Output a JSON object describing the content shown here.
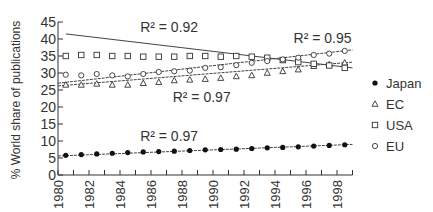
{
  "chart_data": {
    "type": "scatter",
    "title": "",
    "xlabel": "",
    "ylabel": "% World share of publications",
    "xlim": [
      1980,
      1999
    ],
    "ylim": [
      0,
      45
    ],
    "x_ticks": [
      1980,
      1982,
      1984,
      1986,
      1988,
      1990,
      1992,
      1994,
      1996,
      1998
    ],
    "y_ticks": [
      0,
      5,
      10,
      15,
      20,
      25,
      30,
      35,
      40,
      45
    ],
    "grid": false,
    "legend_position": "right",
    "x": [
      1980.5,
      1981.5,
      1982.5,
      1983.5,
      1984.5,
      1985.5,
      1986.5,
      1987.5,
      1988.5,
      1989.5,
      1990.5,
      1991.5,
      1992.5,
      1993.5,
      1994.5,
      1995.5,
      1996.5,
      1997.5,
      1998.5
    ],
    "series": [
      {
        "name": "Japan",
        "marker": "filled-circle",
        "values": [
          5.8,
          6.0,
          6.2,
          6.4,
          6.6,
          6.8,
          6.9,
          7.0,
          7.2,
          7.4,
          7.5,
          7.6,
          7.8,
          8.0,
          8.1,
          8.3,
          8.5,
          8.7,
          8.9
        ],
        "trend": {
          "from": [
            1980,
            5.6
          ],
          "to": [
            1999,
            9.0
          ],
          "r2": "R² = 0.97"
        }
      },
      {
        "name": "EC",
        "marker": "triangle",
        "values": [
          26.5,
          26.5,
          26.8,
          26.5,
          26.5,
          27.0,
          27.3,
          27.8,
          28.0,
          28.2,
          28.5,
          29.0,
          29.3,
          30.0,
          30.5,
          31.0,
          32.0,
          32.5,
          33.0
        ],
        "trend": {
          "from": [
            1980,
            26.2
          ],
          "to": [
            1999,
            33.2
          ],
          "r2": "R² = 0.97"
        }
      },
      {
        "name": "USA",
        "marker": "open-square",
        "values": [
          35.0,
          35.3,
          35.3,
          35.0,
          35.0,
          34.8,
          34.8,
          34.8,
          35.0,
          35.0,
          34.8,
          35.0,
          34.8,
          34.5,
          33.8,
          33.2,
          32.7,
          32.2,
          31.5
        ],
        "trend": {
          "from": [
            1980.5,
            41.5
          ],
          "to": [
            1999,
            31.5
          ],
          "r2": "R² = 0.92"
        }
      },
      {
        "name": "EU",
        "marker": "open-circle",
        "values": [
          29.5,
          29.3,
          29.7,
          29.3,
          29.0,
          29.7,
          30.3,
          30.5,
          30.7,
          31.5,
          31.7,
          32.3,
          33.0,
          33.5,
          34.0,
          34.5,
          35.3,
          35.7,
          36.5
        ],
        "trend": {
          "from": [
            1980,
            27.0
          ],
          "to": [
            1999,
            36.8
          ],
          "r2": "R² = 0.95"
        }
      }
    ],
    "annotations": [
      {
        "text": "R² = 0.92",
        "x": 1985.3,
        "y": 42.0
      },
      {
        "text": "R² = 0.95",
        "x": 1995.2,
        "y": 38.7
      },
      {
        "text": "R² = 0.97",
        "x": 1987.4,
        "y": 21.5
      },
      {
        "text": "R² = 0.97",
        "x": 1985.3,
        "y": 10.0
      }
    ]
  }
}
